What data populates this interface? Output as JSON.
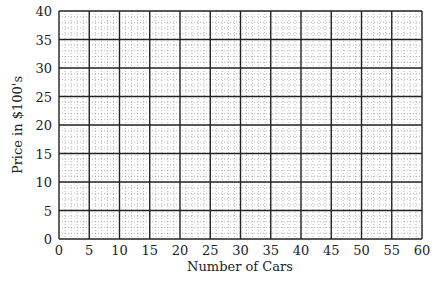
{
  "chart_data": {
    "type": "scatter",
    "title": "",
    "xlabel": "Number of Cars",
    "ylabel": "Price in $100's",
    "xlim": [
      0,
      60
    ],
    "ylim": [
      0,
      40
    ],
    "x_ticks": [
      0,
      5,
      10,
      15,
      20,
      25,
      30,
      35,
      40,
      45,
      50,
      55,
      60
    ],
    "y_ticks": [
      0,
      5,
      10,
      15,
      20,
      25,
      30,
      35,
      40
    ],
    "x_tick_labels": [
      "0",
      "5",
      "10",
      "15",
      "20",
      "25",
      "30",
      "35",
      "40",
      "45",
      "50",
      "55",
      "60"
    ],
    "y_tick_labels": [
      "0",
      "5",
      "10",
      "15",
      "20",
      "25",
      "30",
      "35",
      "40"
    ],
    "grid": true,
    "minor_grid": "dotted",
    "major_grid_step": 5,
    "minor_grid_step": 1,
    "series": [],
    "legend": null,
    "note": "Blank grid, no data plotted"
  },
  "colors": {
    "major_grid": "#222222",
    "minor_grid": "#8a8a8a",
    "background": "#ffffff"
  },
  "plot_area": {
    "left": 59,
    "top": 11,
    "right": 422,
    "bottom": 239
  }
}
